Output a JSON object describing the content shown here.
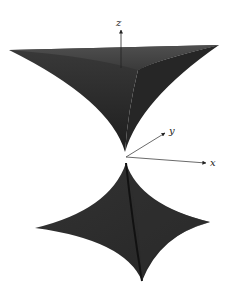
{
  "figure": {
    "axes": {
      "x_label": "x",
      "y_label": "y",
      "z_label": "z"
    },
    "colors": {
      "surface": "#2a2a2a",
      "surface_light": "#4a4a4a",
      "axis": "#333333",
      "background": "#ffffff"
    }
  },
  "caption": {
    "text": ""
  }
}
